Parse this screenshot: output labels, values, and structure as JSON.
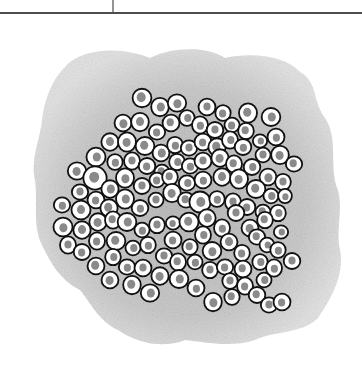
{
  "illustration": {
    "subject": "cluster of cells embedded in extracellular matrix",
    "colors": {
      "background": "#ffffff",
      "rule_line": "#4d4d4d",
      "matrix_fill": "#c8c8c8",
      "matrix_edge": "#e4e4e4",
      "cell_outline": "#111111",
      "cytoplasm": "#ffffff",
      "nucleus": "#8a8a8a"
    },
    "top_rule": {
      "y": 13,
      "thickness": 2,
      "x1": 0,
      "x2": 362
    },
    "top_tick": {
      "x": 113,
      "y1": 0,
      "y2": 13
    },
    "matrix_outline": "M70,62 C95,45 130,50 150,58 C170,48 205,45 225,58 C250,52 285,55 300,72 C318,82 312,100 325,118 C338,138 330,160 336,185 C345,205 335,228 340,250 C345,275 330,300 318,318 C300,335 275,330 255,340 C230,348 205,342 185,340 C165,348 140,345 118,330 C100,322 92,305 80,290 C60,280 50,262 42,245 C32,225 38,200 35,180 C30,160 40,140 42,120 C45,98 52,78 70,62 Z",
    "cells": [
      [
        142,
        98,
        10
      ],
      [
        160,
        107,
        9
      ],
      [
        177,
        103,
        9
      ],
      [
        207,
        107,
        8
      ],
      [
        223,
        113,
        8
      ],
      [
        248,
        113,
        9
      ],
      [
        271,
        117,
        9
      ],
      [
        123,
        123,
        9
      ],
      [
        140,
        122,
        9
      ],
      [
        157,
        132,
        8
      ],
      [
        171,
        123,
        8
      ],
      [
        187,
        118,
        8
      ],
      [
        200,
        125,
        8
      ],
      [
        215,
        130,
        8
      ],
      [
        232,
        125,
        8
      ],
      [
        246,
        131,
        8
      ],
      [
        260,
        141,
        7
      ],
      [
        276,
        137,
        8
      ],
      [
        110,
        142,
        9
      ],
      [
        127,
        142,
        9
      ],
      [
        145,
        146,
        9
      ],
      [
        161,
        153,
        9
      ],
      [
        175,
        145,
        8
      ],
      [
        189,
        148,
        8
      ],
      [
        203,
        142,
        8
      ],
      [
        217,
        147,
        9
      ],
      [
        230,
        140,
        8
      ],
      [
        243,
        147,
        8
      ],
      [
        263,
        155,
        8
      ],
      [
        280,
        155,
        9
      ],
      [
        294,
        164,
        8
      ],
      [
        96,
        157,
        9
      ],
      [
        115,
        162,
        8
      ],
      [
        132,
        161,
        8
      ],
      [
        147,
        166,
        8
      ],
      [
        162,
        172,
        8
      ],
      [
        177,
        162,
        8
      ],
      [
        190,
        166,
        8
      ],
      [
        203,
        161,
        8
      ],
      [
        220,
        158,
        9
      ],
      [
        234,
        164,
        8
      ],
      [
        252,
        167,
        8
      ],
      [
        268,
        177,
        9
      ],
      [
        283,
        182,
        8
      ],
      [
        77,
        171,
        9
      ],
      [
        95,
        178,
        11
      ],
      [
        110,
        189,
        9
      ],
      [
        125,
        178,
        9
      ],
      [
        142,
        186,
        8
      ],
      [
        157,
        180,
        8
      ],
      [
        170,
        177,
        8
      ],
      [
        187,
        183,
        8
      ],
      [
        203,
        180,
        8
      ],
      [
        222,
        177,
        9
      ],
      [
        239,
        179,
        9
      ],
      [
        256,
        189,
        9
      ],
      [
        271,
        196,
        8
      ],
      [
        285,
        196,
        7
      ],
      [
        80,
        192,
        8
      ],
      [
        96,
        200,
        8
      ],
      [
        109,
        208,
        9
      ],
      [
        125,
        199,
        9
      ],
      [
        140,
        208,
        8
      ],
      [
        156,
        200,
        8
      ],
      [
        172,
        193,
        9
      ],
      [
        186,
        200,
        8
      ],
      [
        200,
        202,
        10
      ],
      [
        217,
        199,
        8
      ],
      [
        233,
        202,
        8
      ],
      [
        247,
        207,
        8
      ],
      [
        263,
        212,
        8
      ],
      [
        278,
        213,
        8
      ],
      [
        62,
        205,
        8
      ],
      [
        81,
        210,
        9
      ],
      [
        98,
        222,
        9
      ],
      [
        113,
        220,
        8
      ],
      [
        127,
        222,
        9
      ],
      [
        142,
        230,
        8
      ],
      [
        157,
        225,
        8
      ],
      [
        173,
        223,
        7
      ],
      [
        189,
        222,
        9
      ],
      [
        207,
        218,
        9
      ],
      [
        222,
        228,
        8
      ],
      [
        236,
        213,
        8
      ],
      [
        250,
        228,
        9
      ],
      [
        265,
        220,
        8
      ],
      [
        281,
        232,
        7
      ],
      [
        63,
        227,
        9
      ],
      [
        82,
        230,
        9
      ],
      [
        97,
        241,
        8
      ],
      [
        116,
        241,
        9
      ],
      [
        133,
        248,
        8
      ],
      [
        148,
        245,
        8
      ],
      [
        164,
        256,
        8
      ],
      [
        173,
        240,
        8
      ],
      [
        190,
        247,
        8
      ],
      [
        203,
        235,
        8
      ],
      [
        212,
        251,
        9
      ],
      [
        229,
        242,
        9
      ],
      [
        242,
        253,
        8
      ],
      [
        257,
        237,
        8
      ],
      [
        267,
        245,
        7
      ],
      [
        278,
        250,
        8
      ],
      [
        68,
        245,
        8
      ],
      [
        82,
        252,
        8
      ],
      [
        96,
        266,
        9
      ],
      [
        113,
        257,
        8
      ],
      [
        127,
        267,
        8
      ],
      [
        143,
        268,
        8
      ],
      [
        160,
        276,
        9
      ],
      [
        178,
        262,
        8
      ],
      [
        179,
        279,
        9
      ],
      [
        195,
        262,
        8
      ],
      [
        210,
        270,
        8
      ],
      [
        225,
        267,
        8
      ],
      [
        243,
        269,
        8
      ],
      [
        260,
        262,
        8
      ],
      [
        274,
        268,
        8
      ],
      [
        292,
        261,
        8
      ],
      [
        110,
        280,
        9
      ],
      [
        132,
        285,
        9
      ],
      [
        150,
        293,
        9
      ],
      [
        196,
        288,
        8
      ],
      [
        230,
        281,
        8
      ],
      [
        245,
        286,
        8
      ],
      [
        257,
        295,
        8
      ],
      [
        264,
        280,
        8
      ],
      [
        213,
        302,
        9
      ],
      [
        269,
        305,
        8
      ],
      [
        282,
        302,
        8
      ],
      [
        232,
        297,
        8
      ]
    ]
  }
}
